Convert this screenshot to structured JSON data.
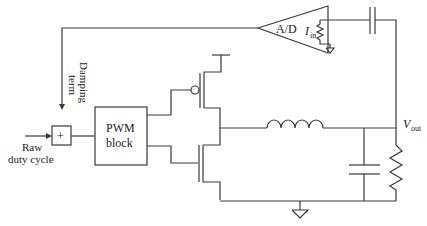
{
  "diagram": {
    "type": "buck converter with digital feedback",
    "labels": {
      "ad_block": "A/D",
      "current_label_main": "I",
      "current_label_sub": "in",
      "damping_term_line1": "Damping",
      "damping_term_line2": "term",
      "summer": "+",
      "raw_duty_line1": "Raw",
      "raw_duty_line2": "duty cycle",
      "pwm_line1": "PWM",
      "pwm_line2": "block",
      "vout_main": "V",
      "vout_sub": "out"
    },
    "components": [
      "A/D converter",
      "sense resistor",
      "coupling capacitor",
      "summing junction",
      "PWM block",
      "PMOS transistor",
      "NMOS transistor",
      "inductor",
      "output capacitor",
      "load resistor",
      "ground"
    ],
    "colors": {
      "line": "#3a3a3a",
      "text": "#222222",
      "background": "#ffffff"
    }
  }
}
